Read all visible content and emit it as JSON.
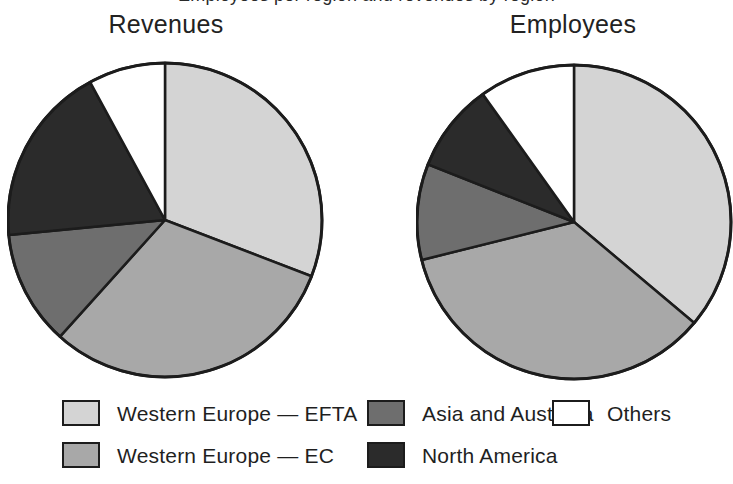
{
  "figure": {
    "partial_caption_top": "Employees per region and revenues by region",
    "titles": {
      "left": "Revenues",
      "right": "Employees"
    }
  },
  "legend": {
    "columns": [
      {
        "items": [
          {
            "label": "Western Europe — EFTA",
            "color": "#d4d4d4",
            "swatch_name": "legend-swatch-western-europe-efta"
          },
          {
            "label": "Western Europe — EC",
            "color": "#a8a8a8",
            "swatch_name": "legend-swatch-western-europe-ec"
          }
        ]
      },
      {
        "items": [
          {
            "label": "Asia and Australia",
            "color": "#6e6e6e",
            "swatch_name": "legend-swatch-asia-and-australia"
          },
          {
            "label": "North America",
            "color": "#2b2b2b",
            "swatch_name": "legend-swatch-north-america"
          }
        ]
      },
      {
        "items": [
          {
            "label": "Others",
            "color": "#ffffff",
            "swatch_name": "legend-swatch-others"
          }
        ]
      }
    ]
  },
  "chart_data": [
    {
      "type": "pie",
      "title": "Revenues",
      "labels": [
        "Western Europe — EFTA",
        "Western Europe — EC",
        "Asia and Australia",
        "North America",
        "Others"
      ],
      "values": [
        30.8,
        30.8,
        11.8,
        18.6,
        7.9
      ],
      "unit": "percent",
      "colors": [
        "#d4d4d4",
        "#a8a8a8",
        "#6e6e6e",
        "#2b2b2b",
        "#ffffff"
      ],
      "start_angle_deg": 0,
      "direction": "clockwise",
      "boundary_angles_deg": [
        0,
        111,
        222,
        264.5,
        331.5,
        360
      ],
      "legend_position": "bottom"
    },
    {
      "type": "pie",
      "title": "Employees",
      "labels": [
        "Western Europe — EFTA",
        "Western Europe — EC",
        "Asia and Australia",
        "North America",
        "Others"
      ],
      "values": [
        36.1,
        35.0,
        9.9,
        9.2,
        9.9
      ],
      "unit": "percent",
      "colors": [
        "#d4d4d4",
        "#a8a8a8",
        "#6e6e6e",
        "#2b2b2b",
        "#ffffff"
      ],
      "start_angle_deg": 0,
      "direction": "clockwise",
      "boundary_angles_deg": [
        0,
        130,
        256,
        291.5,
        324.5,
        360
      ],
      "legend_position": "bottom"
    }
  ],
  "geometry": {
    "pies": [
      {
        "name": "revenues",
        "cx": 158,
        "cy": 160,
        "r": 157
      },
      {
        "name": "employees",
        "cx": 158,
        "cy": 162,
        "r": 157
      }
    ],
    "stroke": "#1c1c1c",
    "stroke_width": 2.5
  }
}
